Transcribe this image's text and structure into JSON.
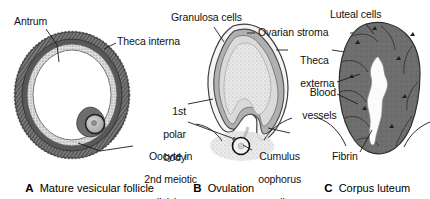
{
  "figure": {
    "background_color": "#ffffff",
    "ink_color": "#111111"
  },
  "panels": [
    {
      "id": "A",
      "letter": "A",
      "caption": "Mature vesicular follicle",
      "labels": [
        {
          "name": "antrum",
          "text": "Antrum"
        },
        {
          "name": "theca-interna",
          "text": "Theca interna"
        },
        {
          "name": "oocyte-2nd-meiotic",
          "text": "Oocyte in\n2nd meiotic\ndivision"
        }
      ]
    },
    {
      "id": "B",
      "letter": "B",
      "caption": "Ovulation",
      "labels": [
        {
          "name": "granulosa-cells",
          "text": "Granulosa cells"
        },
        {
          "name": "ovarian-stroma",
          "text": "Ovarian stroma"
        },
        {
          "name": "theca-externa",
          "text": "Theca\nexterna"
        },
        {
          "name": "first-polar-body",
          "text": "1st\npolar\nbody"
        },
        {
          "name": "cumulus-oophorus-cells",
          "text": "Cumulus\noophorus\ncells"
        }
      ]
    },
    {
      "id": "C",
      "letter": "C",
      "caption": "Corpus luteum",
      "labels": [
        {
          "name": "luteal-cells",
          "text": "Luteal cells"
        },
        {
          "name": "blood-vessels",
          "text": "Blood\nvessels"
        },
        {
          "name": "fibrin",
          "text": "Fibrin"
        }
      ]
    }
  ],
  "labels_flat": {
    "antrum": "Antrum",
    "theca_interna": "Theca interna",
    "oocyte_line1": "Oocyte in",
    "oocyte_line2": "2nd meiotic",
    "oocyte_line3": "division",
    "granulosa_cells": "Granulosa cells",
    "ovarian_stroma": "Ovarian stroma",
    "theca_externa_line1": "Theca",
    "theca_externa_line2": "externa",
    "polar_line1": "1st",
    "polar_line2": "polar",
    "polar_line3": "body",
    "cumulus_line1": "Cumulus",
    "cumulus_line2": "oophorus",
    "cumulus_line3": "cells",
    "luteal_cells": "Luteal cells",
    "blood_line1": "Blood",
    "blood_line2": "vessels",
    "fibrin": "Fibrin"
  },
  "captions": {
    "a_letter": "A",
    "a_text": "Mature vesicular follicle",
    "b_letter": "B",
    "b_text": "Ovulation",
    "c_letter": "C",
    "c_text": "Corpus luteum"
  },
  "colors": {
    "theca_dark": "#6e6e6e",
    "theca_outer": "#8a8a8a",
    "granulosa_light": "#d8d8d8",
    "antrum_white": "#ffffff",
    "oocyte_fill": "#b8b8b8",
    "luteal_fill": "#6b6b6b",
    "fibrin_white": "#fbfbfb",
    "stipple": "#9a9a9a",
    "leader_line": "#222222"
  }
}
